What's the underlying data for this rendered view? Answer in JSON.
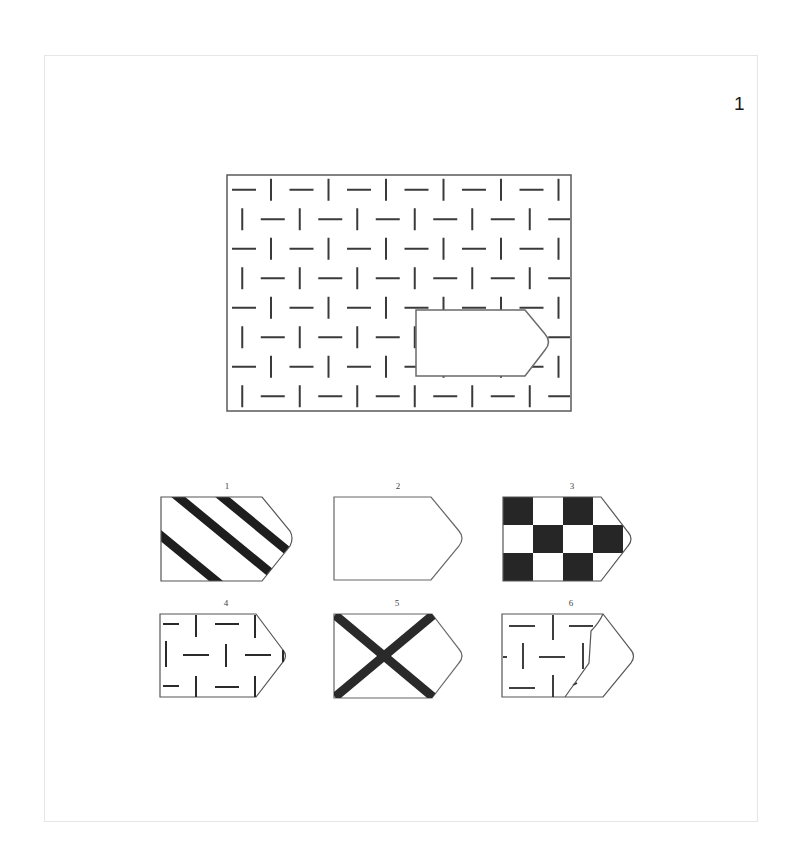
{
  "page": {
    "page_number": "1"
  },
  "puzzle": {
    "type": "pattern-completion",
    "main_pattern": {
      "description": "grid of alternating short horizontal and vertical dashes",
      "rows": 8,
      "missing_piece_shape": "pentagon-arrow"
    },
    "options": [
      {
        "label": "1",
        "pattern": "diagonal-stripes"
      },
      {
        "label": "2",
        "pattern": "blank"
      },
      {
        "label": "3",
        "pattern": "checkerboard"
      },
      {
        "label": "4",
        "pattern": "dash-grid"
      },
      {
        "label": "5",
        "pattern": "x-cross"
      },
      {
        "label": "6",
        "pattern": "dash-grid-partial"
      }
    ]
  },
  "colors": {
    "line": "#3a3a3a",
    "fill_dark": "#2b2b2b",
    "frame_border": "#e6e6e6"
  }
}
